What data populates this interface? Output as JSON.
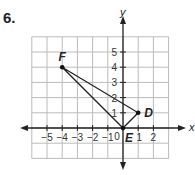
{
  "problem_number": "6.",
  "chart_data": {
    "type": "scatter",
    "title": "",
    "xlabel": "x",
    "ylabel": "y",
    "xlim": [
      -6,
      3
    ],
    "ylim": [
      -2,
      6
    ],
    "grid": true,
    "x_ticks": [
      "-5",
      "-4",
      "-3",
      "-2",
      "-1",
      "2"
    ],
    "x_tick_values": [
      -5,
      -4,
      -3,
      -2,
      -1,
      2
    ],
    "y_ticks": [
      "1",
      "2",
      "3",
      "4",
      "5"
    ],
    "y_tick_values": [
      1,
      2,
      3,
      4,
      5
    ],
    "origin_label": "0",
    "points": [
      {
        "name": "F",
        "x": -4,
        "y": 4
      },
      {
        "name": "D",
        "x": 1,
        "y": 1
      },
      {
        "name": "E",
        "x": 0,
        "y": 0
      }
    ],
    "x_one_label": "1",
    "polygon": [
      "F",
      "D",
      "E"
    ]
  }
}
